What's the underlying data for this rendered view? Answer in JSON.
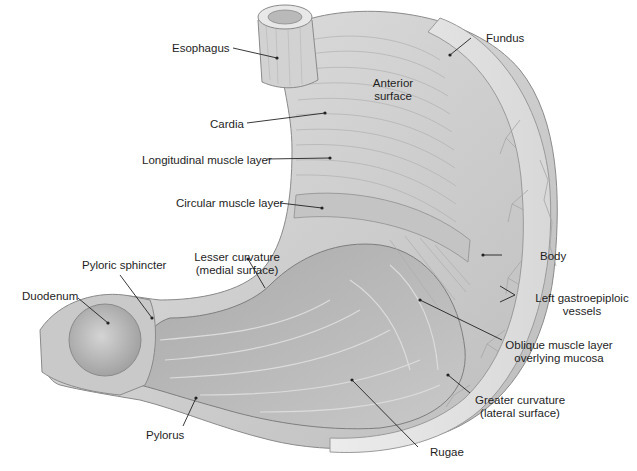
{
  "figure": {
    "colors": {
      "tissue_light": "#e6e6e6",
      "tissue_mid": "#c8c8c8",
      "tissue_dark": "#9a9a9a",
      "mucosa": "#b5b5b5",
      "leader_line": "#222222",
      "label_text": "#1e1e1e"
    },
    "labels": {
      "esophagus": "Esophagus",
      "fundus": "Fundus",
      "anterior_surface_1": "Anterior",
      "anterior_surface_2": "surface",
      "cardia": "Cardia",
      "longitudinal": "Longitudinal muscle layer",
      "circular": "Circular muscle layer",
      "body": "Body",
      "lesser_curvature_1": "Lesser curvature",
      "lesser_curvature_2": "(medial surface)",
      "pyloric_sphincter": "Pyloric sphincter",
      "duodenum": "Duodenum",
      "left_gastro_1": "Left gastroepiploic",
      "left_gastro_2": "vessels",
      "oblique_1": "Oblique muscle layer",
      "oblique_2": "overlying mucosa",
      "greater_curvature_1": "Greater curvature",
      "greater_curvature_2": "(lateral surface)",
      "pylorus": "Pylorus",
      "rugae": "Rugae"
    }
  }
}
